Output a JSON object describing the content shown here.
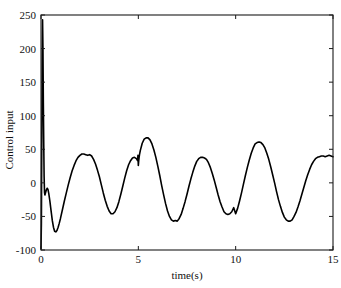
{
  "chart_data": {
    "type": "line",
    "title": "",
    "xlabel": "time(s)",
    "ylabel": "Control input",
    "xlim": [
      0,
      15
    ],
    "ylim": [
      -100,
      250
    ],
    "xticks": [
      0,
      5,
      10,
      15
    ],
    "xticklabels": [
      "0",
      "5",
      "10",
      "15"
    ],
    "yticks": [
      -100,
      -50,
      0,
      50,
      100,
      150,
      200,
      250
    ],
    "yticklabels": [
      "-100",
      "-50",
      "0",
      "50",
      "100",
      "150",
      "200",
      "250"
    ],
    "grid": false,
    "legend": null,
    "line_color": "#000000",
    "line_width": 1.6,
    "annotations": [
      {
        "text": "initial transient spike",
        "x": 0.12,
        "y": 243
      },
      {
        "text": "small switching glitch",
        "x": 5.0,
        "y": 30
      }
    ],
    "series": [
      {
        "name": "control input u(t)",
        "x": [
          0.0,
          0.02,
          0.04,
          0.06,
          0.08,
          0.1,
          0.12,
          0.14,
          0.16,
          0.18,
          0.2,
          0.24,
          0.28,
          0.32,
          0.36,
          0.4,
          0.46,
          0.52,
          0.58,
          0.64,
          0.7,
          0.76,
          0.82,
          0.88,
          0.94,
          1.0,
          1.1,
          1.2,
          1.3,
          1.4,
          1.5,
          1.6,
          1.7,
          1.8,
          1.9,
          2.0,
          2.1,
          2.2,
          2.3,
          2.4,
          2.5,
          2.6,
          2.7,
          2.8,
          2.9,
          3.0,
          3.1,
          3.2,
          3.3,
          3.4,
          3.5,
          3.6,
          3.7,
          3.8,
          3.9,
          4.0,
          4.1,
          4.2,
          4.3,
          4.4,
          4.5,
          4.6,
          4.7,
          4.8,
          4.9,
          4.96,
          4.98,
          5.0,
          5.02,
          5.04,
          5.06,
          5.1,
          5.2,
          5.3,
          5.4,
          5.5,
          5.6,
          5.7,
          5.8,
          5.9,
          6.0,
          6.1,
          6.2,
          6.3,
          6.4,
          6.5,
          6.6,
          6.7,
          6.8,
          6.9,
          7.0,
          7.1,
          7.2,
          7.3,
          7.4,
          7.5,
          7.6,
          7.7,
          7.8,
          7.9,
          8.0,
          8.1,
          8.2,
          8.3,
          8.4,
          8.5,
          8.6,
          8.7,
          8.8,
          8.9,
          9.0,
          9.1,
          9.2,
          9.3,
          9.4,
          9.5,
          9.6,
          9.7,
          9.8,
          9.9,
          10.0,
          10.1,
          10.2,
          10.3,
          10.4,
          10.5,
          10.6,
          10.7,
          10.8,
          10.9,
          11.0,
          11.1,
          11.2,
          11.3,
          11.4,
          11.5,
          11.6,
          11.7,
          11.8,
          11.9,
          12.0,
          12.1,
          12.2,
          12.3,
          12.4,
          12.5,
          12.6,
          12.7,
          12.8,
          12.9,
          13.0,
          13.1,
          13.2,
          13.3,
          13.4,
          13.5,
          13.6,
          13.7,
          13.8,
          13.9,
          14.0,
          14.1,
          14.2,
          14.3,
          14.4,
          14.5,
          14.6,
          14.7,
          14.8,
          14.9,
          15.0
        ],
        "y": [
          -98,
          -60,
          60,
          180,
          243,
          200,
          120,
          60,
          10,
          -14,
          -18,
          -14,
          -10,
          -8,
          -10,
          -16,
          -28,
          -42,
          -56,
          -66,
          -72,
          -73,
          -71,
          -66,
          -60,
          -53,
          -40,
          -27,
          -15,
          -3,
          8,
          18,
          26,
          33,
          38,
          41,
          43,
          43,
          42,
          41,
          42,
          40,
          35,
          28,
          19,
          9,
          -3,
          -15,
          -26,
          -35,
          -42,
          -46,
          -46,
          -43,
          -37,
          -28,
          -17,
          -5,
          7,
          18,
          27,
          33,
          37,
          38,
          36,
          33,
          41,
          26,
          33,
          38,
          42,
          48,
          59,
          65,
          67,
          67,
          64,
          58,
          49,
          38,
          25,
          11,
          -4,
          -18,
          -31,
          -42,
          -50,
          -55,
          -57,
          -56,
          -57,
          -53,
          -47,
          -38,
          -28,
          -17,
          -5,
          6,
          16,
          25,
          32,
          36,
          38,
          38,
          37,
          35,
          30,
          23,
          14,
          4,
          -7,
          -18,
          -28,
          -36,
          -43,
          -46,
          -47,
          -46,
          -43,
          -37,
          -46,
          -38,
          -27,
          -15,
          -2,
          11,
          23,
          34,
          44,
          52,
          58,
          60,
          61,
          60,
          57,
          52,
          44,
          35,
          24,
          12,
          0,
          -13,
          -25,
          -35,
          -44,
          -51,
          -55,
          -57,
          -57,
          -55,
          -50,
          -44,
          -36,
          -27,
          -17,
          -7,
          3,
          12,
          20,
          27,
          32,
          36,
          38,
          39,
          40,
          40,
          39,
          40,
          41,
          40,
          39
        ]
      }
    ]
  },
  "axes": {
    "box_color": "#1a1a1a",
    "background": "#ffffff"
  }
}
